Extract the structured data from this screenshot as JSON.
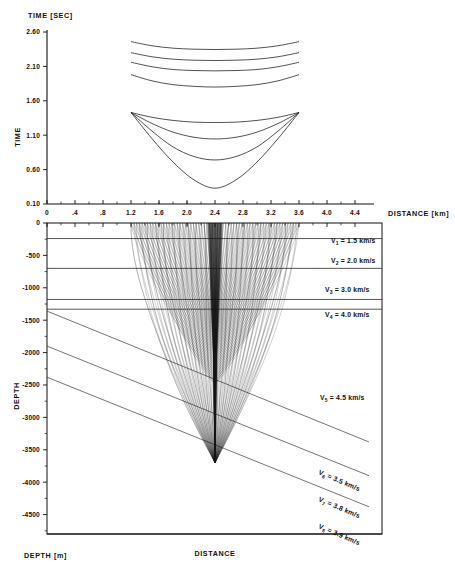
{
  "figure": {
    "top_panel": {
      "axis_header": "TIME  [SEC]",
      "y_axis_label": "TIME",
      "y_ticks": [
        "2.60",
        "2.10",
        "1.60",
        "1.10",
        "0.60",
        "0.10"
      ],
      "y_values": [
        2.6,
        2.1,
        1.6,
        1.1,
        0.6,
        0.1
      ]
    },
    "x_axis": {
      "label": "DISTANCE  [km]",
      "ticks": [
        "0",
        ".4",
        ".8",
        "1.2",
        "1.6",
        "2.0",
        "2.4",
        "2.8",
        "3.2",
        "3.6",
        "4.0",
        "4.4"
      ],
      "values": [
        0,
        0.4,
        0.8,
        1.2,
        1.6,
        2.0,
        2.4,
        2.8,
        3.2,
        3.6,
        4.0,
        4.4
      ]
    },
    "bottom_panel": {
      "y_axis_label": "DEPTH",
      "x_axis_label": "DISTANCE",
      "corner_label": "DEPTH  [m]",
      "y_ticks": [
        "0",
        "-500",
        "-1000",
        "-1500",
        "-2000",
        "-2500",
        "-3000",
        "-3500",
        "-4000",
        "-4500"
      ],
      "y_values": [
        0,
        -500,
        -1000,
        -1500,
        -2000,
        -2500,
        -3000,
        -3500,
        -4000,
        -4500
      ]
    },
    "velocities": [
      {
        "symbol": "V",
        "index": "1",
        "eq": "=",
        "value": "1.5 km/s",
        "depth_top": 0,
        "depth_bottom": -240,
        "rotated": false
      },
      {
        "symbol": "V",
        "index": "2",
        "eq": "=",
        "value": "2.0 km/s",
        "depth_top": -240,
        "depth_bottom": -700,
        "rotated": false
      },
      {
        "symbol": "V",
        "index": "3",
        "eq": "=",
        "value": "3.0 km/s",
        "depth_top": -700,
        "depth_bottom": -1180,
        "rotated": false
      },
      {
        "symbol": "V",
        "index": "4",
        "eq": "=",
        "value": "4.0 km/s",
        "depth_top": -1180,
        "depth_bottom": -1330,
        "rotated": false
      },
      {
        "symbol": "V",
        "index": "5",
        "eq": "=",
        "value": "4.5 km/s",
        "depth_top": -1330,
        "depth_bottom": -2600,
        "rotated": false
      },
      {
        "symbol": "V",
        "index": "6",
        "eq": "=",
        "value": "3.5 km/s",
        "depth_top": -2600,
        "depth_bottom": -3200,
        "rotated": true
      },
      {
        "symbol": "V",
        "index": "7",
        "eq": "=",
        "value": "3.8 km/s",
        "depth_top": -3200,
        "depth_bottom": -3700,
        "rotated": true
      },
      {
        "symbol": "V",
        "index": "8",
        "eq": "=",
        "value": "3.9 km/s",
        "depth_top": -3700,
        "depth_bottom": -4600,
        "rotated": true
      }
    ]
  },
  "chart_data": {
    "type": "line",
    "title": "",
    "xlabel": "DISTANCE  [km]",
    "ylabel": "TIME  [SEC]",
    "xlim": [
      0,
      4.6
    ],
    "ylim": [
      0.1,
      2.6
    ],
    "grid": false,
    "legend": "none",
    "note": "Seismic travel-time curves (upper panel) and ray-path / layered velocity model (lower panel). Source point at x = 2.4 km.",
    "x_tick_labels": [
      "0",
      ".4",
      ".8",
      "1.2",
      "1.6",
      "2.0",
      "2.4",
      "2.8",
      "3.2",
      "3.6",
      "4.0",
      "4.4"
    ],
    "y_tick_labels": [
      "2.60",
      "2.10",
      "1.60",
      "1.10",
      "0.60",
      "0.10"
    ],
    "series": [
      {
        "name": "branch-1",
        "x": [
          1.2,
          1.5,
          1.8,
          2.1,
          2.4,
          2.7,
          3.0,
          3.3,
          3.6
        ],
        "y": [
          2.46,
          2.4,
          2.365,
          2.35,
          2.345,
          2.35,
          2.365,
          2.4,
          2.46
        ]
      },
      {
        "name": "branch-2",
        "x": [
          1.2,
          1.5,
          1.8,
          2.1,
          2.4,
          2.7,
          3.0,
          3.3,
          3.6
        ],
        "y": [
          2.3,
          2.24,
          2.205,
          2.19,
          2.185,
          2.19,
          2.205,
          2.24,
          2.3
        ]
      },
      {
        "name": "branch-3",
        "x": [
          1.2,
          1.5,
          1.8,
          2.1,
          2.4,
          2.7,
          3.0,
          3.3,
          3.6
        ],
        "y": [
          2.16,
          2.095,
          2.055,
          2.04,
          2.035,
          2.04,
          2.055,
          2.095,
          2.16
        ]
      },
      {
        "name": "branch-4",
        "x": [
          1.2,
          1.5,
          1.8,
          2.1,
          2.4,
          2.7,
          3.0,
          3.3,
          3.6
        ],
        "y": [
          1.98,
          1.89,
          1.835,
          1.81,
          1.8,
          1.81,
          1.835,
          1.89,
          1.98
        ]
      },
      {
        "name": "branch-5",
        "x": [
          1.2,
          1.5,
          1.8,
          2.1,
          2.4,
          2.7,
          3.0,
          3.3,
          3.6
        ],
        "y": [
          1.43,
          1.36,
          1.315,
          1.29,
          1.285,
          1.29,
          1.315,
          1.36,
          1.43
        ]
      },
      {
        "name": "branch-6",
        "x": [
          1.2,
          1.5,
          1.8,
          2.1,
          2.4,
          2.7,
          3.0,
          3.3,
          3.6
        ],
        "y": [
          1.43,
          1.27,
          1.145,
          1.07,
          1.045,
          1.07,
          1.145,
          1.27,
          1.43
        ]
      },
      {
        "name": "branch-7",
        "x": [
          1.2,
          1.5,
          1.8,
          2.1,
          2.4,
          2.7,
          3.0,
          3.3,
          3.6
        ],
        "y": [
          1.43,
          1.16,
          0.93,
          0.79,
          0.74,
          0.79,
          0.93,
          1.16,
          1.43
        ]
      },
      {
        "name": "branch-8",
        "x": [
          1.2,
          1.5,
          1.8,
          2.1,
          2.4,
          2.7,
          3.0,
          3.3,
          3.6
        ],
        "y": [
          1.43,
          1.05,
          0.71,
          0.45,
          0.33,
          0.45,
          0.71,
          1.05,
          1.43
        ]
      }
    ],
    "model": {
      "type": "layered-velocity-model",
      "source_x_km": 2.4,
      "ray_span_km": [
        1.2,
        3.6
      ],
      "focus_depth_m": -3700,
      "layer_velocities_km_s": [
        1.5,
        2.0,
        3.0,
        4.0,
        4.5,
        3.5,
        3.8,
        3.9
      ],
      "horizontal_interfaces_m": [
        -240,
        -700,
        -1180,
        -1330
      ],
      "dipping_interfaces": [
        {
          "name": "top-V6",
          "x0_km": 0.0,
          "z0_m": -1360,
          "x1_km": 4.6,
          "z1_m": -3380
        },
        {
          "name": "top-V7",
          "x0_km": 0.0,
          "z0_m": -1900,
          "x1_km": 4.6,
          "z1_m": -3900
        },
        {
          "name": "top-V8",
          "x0_km": 0.0,
          "z0_m": -2380,
          "x1_km": 4.6,
          "z1_m": -4380
        }
      ]
    }
  }
}
